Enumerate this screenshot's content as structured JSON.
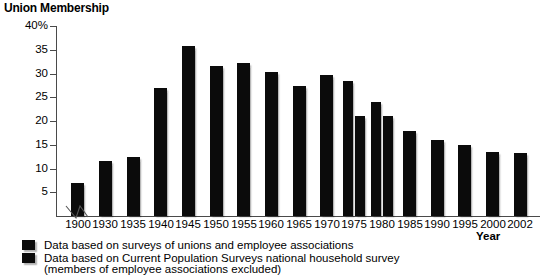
{
  "chart_data": {
    "type": "bar",
    "title": "Union Membership",
    "xlabel": "Year",
    "ylabel": "",
    "ylim": [
      0,
      40
    ],
    "grid": false,
    "legend_position": "below",
    "y_ticks": [
      "40%",
      "35",
      "30",
      "25",
      "20",
      "15",
      "10",
      "5"
    ],
    "y_tick_values": [
      40,
      35,
      30,
      25,
      20,
      15,
      10,
      5
    ],
    "categories": [
      "1900",
      "1930",
      "1935",
      "1940",
      "1945",
      "1950",
      "1955",
      "1960",
      "1965",
      "1970",
      "1975",
      "1980",
      "1985",
      "1990",
      "1995",
      "2000",
      "2002"
    ],
    "axis_break_after": "1900",
    "series": [
      {
        "name": "Data based on surveys of unions and employee associations",
        "values": [
          7.0,
          11.6,
          12.5,
          26.9,
          35.8,
          31.5,
          32.3,
          30.4,
          27.4,
          29.6,
          28.5,
          24.0,
          null,
          null,
          null,
          null,
          null
        ]
      },
      {
        "name": "Data based on Current Population Surveys national household survey (members of employee associations excluded)",
        "values": [
          null,
          null,
          null,
          null,
          null,
          null,
          null,
          null,
          null,
          null,
          21.1,
          21.0,
          17.8,
          16.1,
          14.9,
          13.5,
          13.3
        ]
      }
    ],
    "annotations": []
  },
  "legend": {
    "items": [
      {
        "label": "Data based on surveys of unions and employee associations",
        "swatch_color": "#0b0b0b"
      },
      {
        "label": "Data based on Current Population Surveys national household survey",
        "swatch_color": "#0b0b0b"
      }
    ],
    "note": "(members of employee associations excluded)"
  },
  "colors": {
    "bar": "#0b0b0b",
    "axis": "#4a4a4a",
    "text": "#000000",
    "background": "#ffffff"
  }
}
